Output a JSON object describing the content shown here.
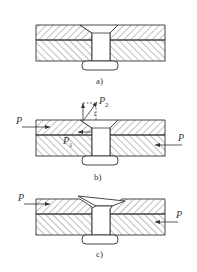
{
  "figure": {
    "panels": [
      {
        "id": "a",
        "caption": "a)"
      },
      {
        "id": "b",
        "caption": "b)",
        "labels": {
          "force_left": "P",
          "force_right": "P",
          "p1": "P",
          "p1_sub": "1",
          "p2": "P",
          "p2_sub": "2",
          "angle_mark": "1"
        }
      },
      {
        "id": "c",
        "caption": "c)",
        "labels": {
          "force_left": "P",
          "force_right": "P"
        }
      }
    ]
  },
  "colors": {
    "line": "#333333",
    "background": "#ffffff"
  }
}
